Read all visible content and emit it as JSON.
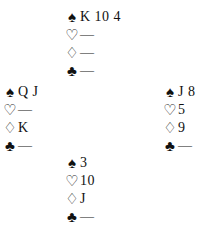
{
  "diagram": {
    "type": "bridge-deal",
    "hands": {
      "north": {
        "spades": "K 10 4",
        "hearts": "—",
        "diamonds": "—",
        "clubs": "—"
      },
      "west": {
        "spades": "Q J",
        "hearts": "—",
        "diamonds": "K",
        "clubs": "—"
      },
      "east": {
        "spades": "J 8",
        "hearts": "5",
        "diamonds": "9",
        "clubs": "—"
      },
      "south": {
        "spades": "3",
        "hearts": "10",
        "diamonds": "J",
        "clubs": "—"
      }
    },
    "suit_symbols": {
      "spades": "♠",
      "hearts": "♡",
      "diamonds": "♢",
      "clubs": "♣"
    }
  }
}
